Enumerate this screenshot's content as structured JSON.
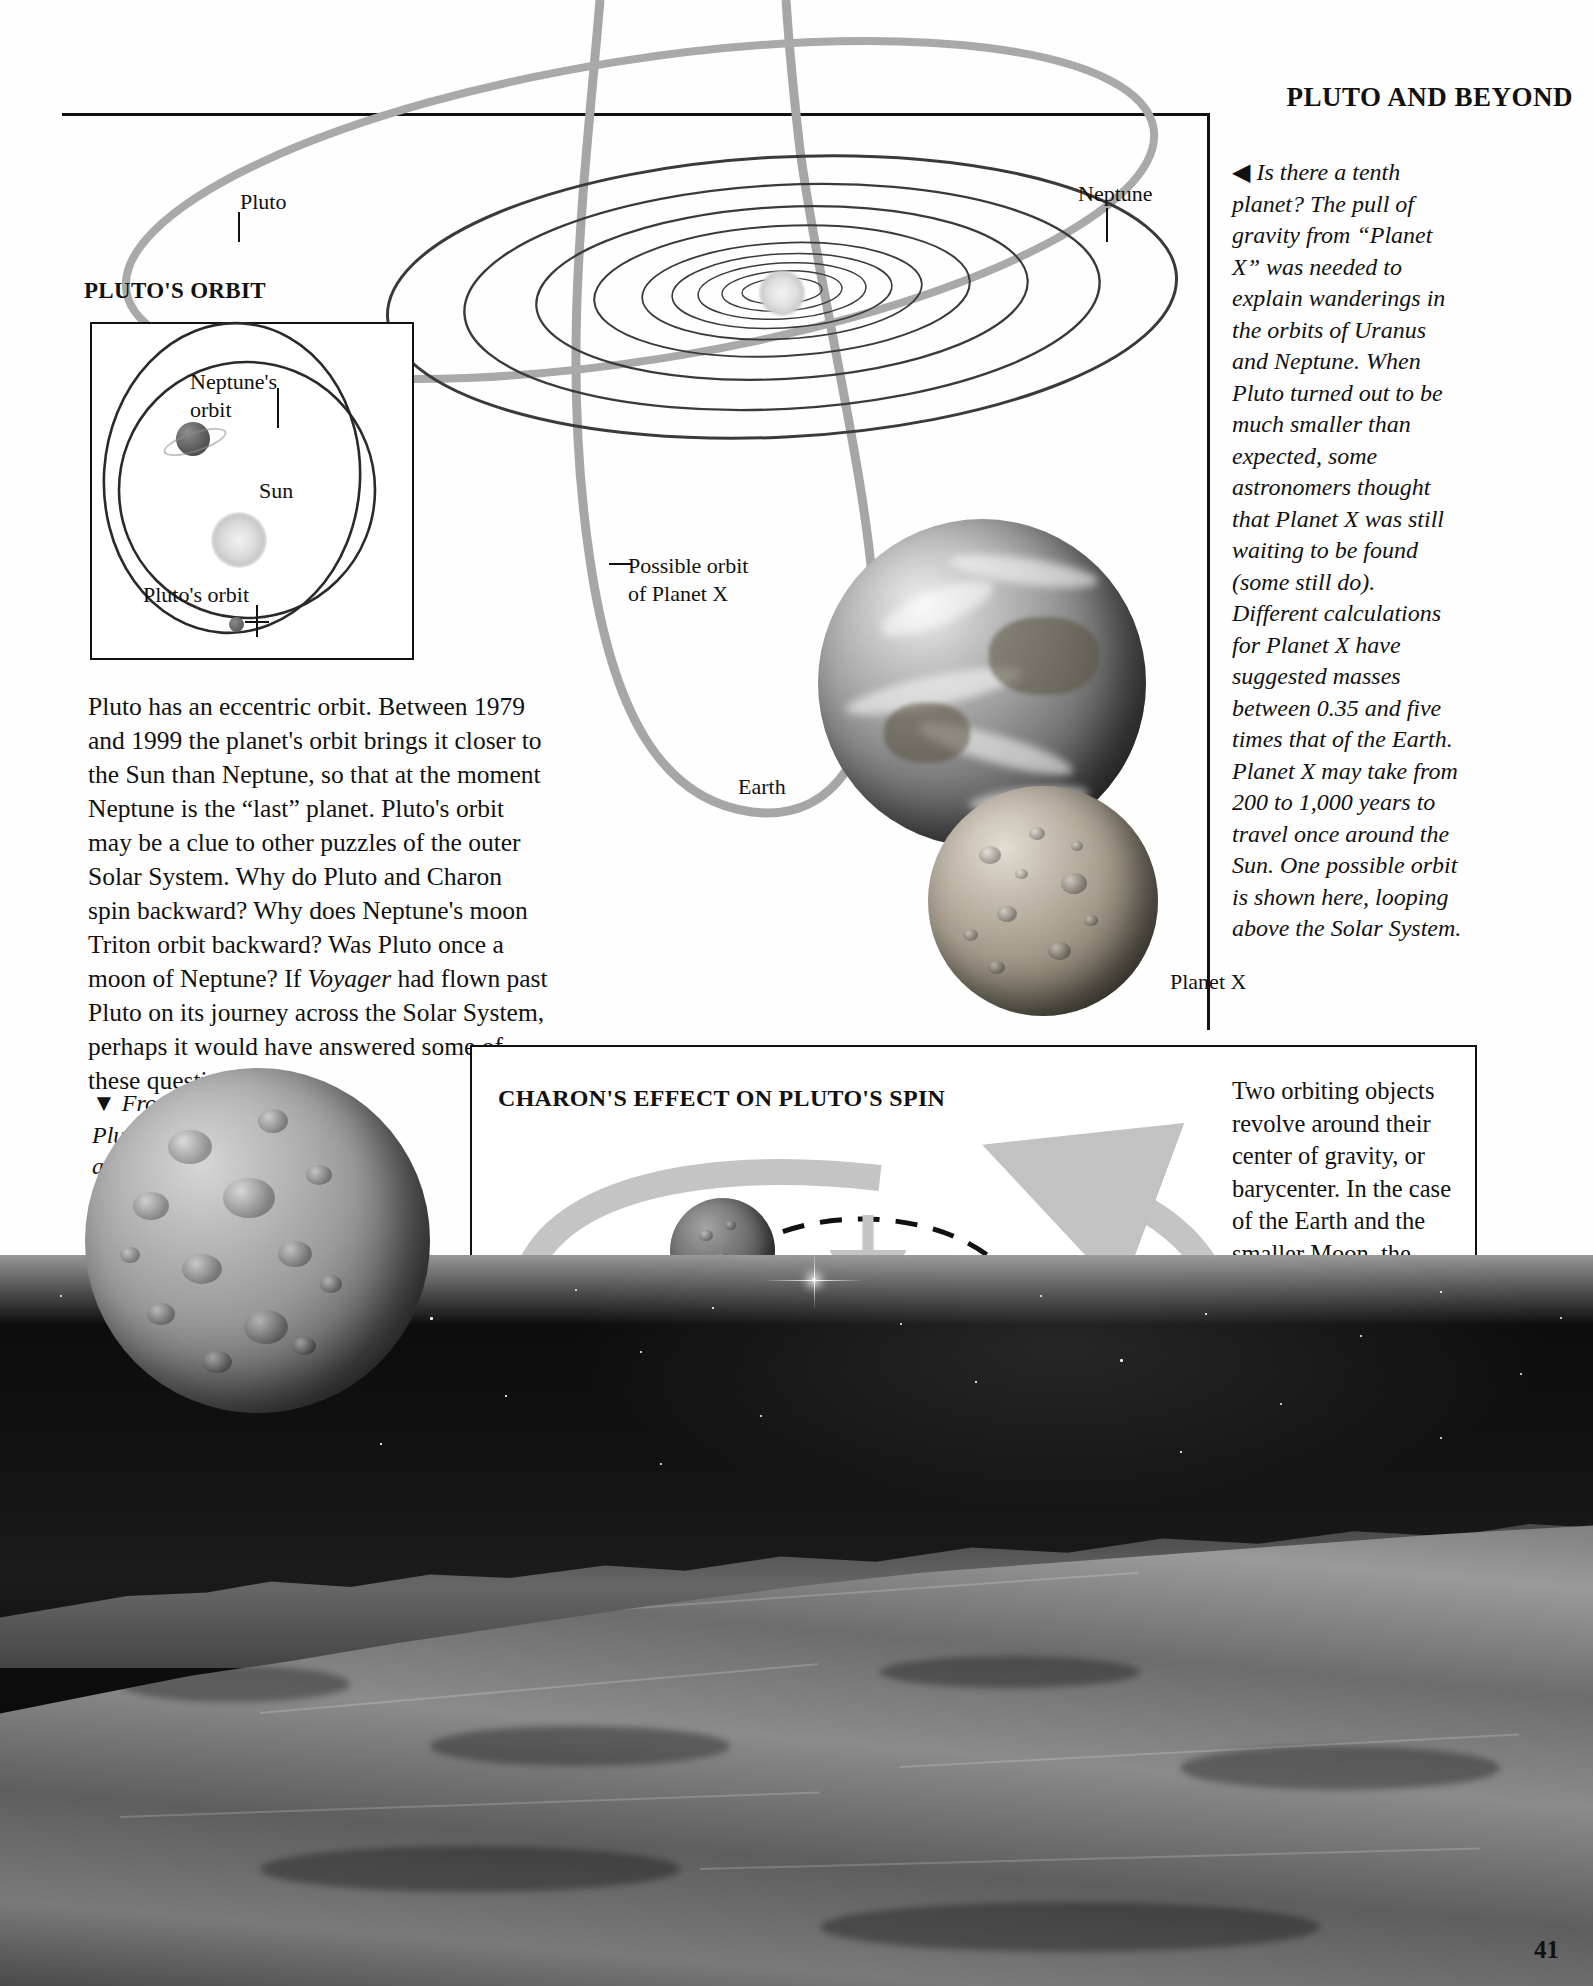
{
  "page": {
    "title": "PLUTO AND BEYOND",
    "number": "41"
  },
  "sections": {
    "plutos_orbit_title": "PLUTO'S ORBIT",
    "charons_effect_title": "CHARON'S EFFECT ON PLUTO'S SPIN"
  },
  "diagram_labels": {
    "pluto": "Pluto",
    "neptune": "Neptune",
    "earth": "Earth",
    "planet_x": "Planet X",
    "possible_orbit_line1": "Possible orbit",
    "possible_orbit_line2": "of  Planet X"
  },
  "inset_labels": {
    "neptunes_orbit_line1": "Neptune's",
    "neptunes_orbit_line2": "orbit",
    "sun": "Sun",
    "plutos_orbit": "Pluto's orbit"
  },
  "charon_box_labels": {
    "pluto": "Pluto",
    "charon": "Charon",
    "center_line1": "Center",
    "center_line2": "of gravity"
  },
  "text": {
    "planet_x_caption_marker": "◀",
    "planet_x_caption": "Is there a tenth planet? The pull of gravity from “Planet X” was needed to explain wanderings in the orbits of Uranus and Neptune. When Pluto turned out to be much smaller than expected, some astronomers thought that Planet X was still waiting to be found (some still do). Different calculations for Planet X have suggested masses between 0.35 and five times that of the Earth. Planet X may take from 200 to 1,000 years to travel once around the Sun. One possible orbit is shown here, looping above the Solar System.",
    "pluto_orbit_body_part1": "Pluto has an eccentric orbit. Between 1979 and 1999 the planet's orbit brings it closer to the Sun than Neptune, so that at the moment Neptune is the “last” planet. Pluto's orbit may be a clue to other puzzles of the outer Solar System. Why do Pluto and Charon spin backward? Why does Neptune's moon Triton orbit backward? Was Pluto once a moon of Neptune? If ",
    "pluto_orbit_body_italic": "Voyager",
    "pluto_orbit_body_part2": " had flown past Pluto on its journey across the Solar System, perhaps it would have answered some of these questions.",
    "icy_surface_marker": "▼",
    "icy_surface_caption": "From the icy surface of Pluto, Charon would appear seven times the diameter of our own Moon. Charon does not rise or set, because the same side of Pluto always faces it.",
    "barycenter_body": "Two orbiting objects revolve around their center of gravity, or barycenter. In the case of the Earth and the smaller Moon, the barycenter is inside the Earth. However, Charon has a quarter of Pluto's mass. This pulls the barycenter to a point in space between them, so that Pluto, as well as Charon, moves in a circle."
  },
  "colors": {
    "ink": "#111111",
    "orbit_gray": "#9a9a9a",
    "arrow_gray": "#b5b5b5",
    "paper": "#ffffff"
  }
}
